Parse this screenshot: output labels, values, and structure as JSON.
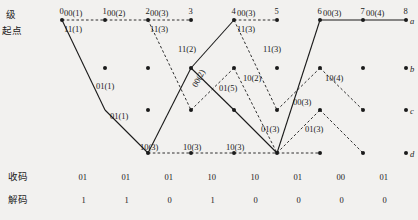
{
  "figure": {
    "type": "viterbi-trellis-diagram",
    "row_labels_left": [
      "级",
      "起点"
    ],
    "state_labels_right": [
      "a",
      "b",
      "c",
      "d"
    ],
    "stage_numbers": [
      "0",
      "1",
      "2",
      "3",
      "4",
      "5",
      "6",
      "7",
      "8"
    ],
    "bottom_rows": [
      {
        "name": "收码",
        "values": [
          "01",
          "01",
          "01",
          "10",
          "10",
          "01",
          "00",
          "01"
        ]
      },
      {
        "name": "解码",
        "values": [
          "1",
          "1",
          "0",
          "1",
          "0",
          "0",
          "0",
          "0"
        ]
      }
    ],
    "branch_labels": [
      {
        "text": "00(1)",
        "x": 64,
        "y": 9
      },
      {
        "text": "00(2)",
        "x": 107,
        "y": 9
      },
      {
        "text": "00(3)",
        "x": 150,
        "y": 9
      },
      {
        "text": "00(3)",
        "x": 237,
        "y": 9
      },
      {
        "text": "00(3)",
        "x": 323,
        "y": 9
      },
      {
        "text": "00(4)",
        "x": 366,
        "y": 9
      },
      {
        "text": "11(1)",
        "x": 64,
        "y": 25
      },
      {
        "text": "11(3)",
        "x": 150,
        "y": 25
      },
      {
        "text": "11(3)",
        "x": 237,
        "y": 25
      },
      {
        "text": "11(2)",
        "x": 178,
        "y": 45
      },
      {
        "text": "11(3)",
        "x": 263,
        "y": 45
      },
      {
        "text": "01(1)",
        "x": 96,
        "y": 82
      },
      {
        "text": "01(1)",
        "x": 110,
        "y": 112
      },
      {
        "text": "01(5)",
        "x": 219,
        "y": 84
      },
      {
        "text": "10(2)",
        "x": 243,
        "y": 74
      },
      {
        "text": "10(4)",
        "x": 325,
        "y": 74
      },
      {
        "text": "00(3)",
        "x": 293,
        "y": 98
      },
      {
        "text": "01(3)",
        "x": 261,
        "y": 125
      },
      {
        "text": "01(3)",
        "x": 305,
        "y": 125
      },
      {
        "text": "10(3)",
        "x": 140,
        "y": 143
      },
      {
        "text": "10(3)",
        "x": 183,
        "y": 143
      },
      {
        "text": "10(3)",
        "x": 226,
        "y": 143
      }
    ],
    "rotated_label": {
      "text": "00(2)",
      "x": 198,
      "y": 80
    },
    "colors": {
      "ink": "#1a1a1a",
      "paper": "#f2f1ef"
    }
  },
  "chart_data": {
    "type": "diagram",
    "columns_x": [
      62,
      105,
      148,
      191,
      234,
      277,
      320,
      363,
      406
    ],
    "rows_y": {
      "a": 20,
      "b": 68,
      "c": 110,
      "d": 153
    },
    "nodes": [
      {
        "stage": 0,
        "state": "a"
      },
      {
        "stage": 1,
        "state": "a"
      },
      {
        "stage": 1,
        "state": "b"
      },
      {
        "stage": 2,
        "state": "a"
      },
      {
        "stage": 2,
        "state": "b"
      },
      {
        "stage": 2,
        "state": "c"
      },
      {
        "stage": 2,
        "state": "d"
      },
      {
        "stage": 3,
        "state": "a"
      },
      {
        "stage": 3,
        "state": "b"
      },
      {
        "stage": 3,
        "state": "c"
      },
      {
        "stage": 3,
        "state": "d"
      },
      {
        "stage": 4,
        "state": "a"
      },
      {
        "stage": 4,
        "state": "b"
      },
      {
        "stage": 4,
        "state": "c"
      },
      {
        "stage": 4,
        "state": "d"
      },
      {
        "stage": 5,
        "state": "a"
      },
      {
        "stage": 5,
        "state": "b"
      },
      {
        "stage": 5,
        "state": "c"
      },
      {
        "stage": 5,
        "state": "d"
      },
      {
        "stage": 6,
        "state": "a"
      },
      {
        "stage": 6,
        "state": "b"
      },
      {
        "stage": 6,
        "state": "c"
      },
      {
        "stage": 6,
        "state": "d"
      },
      {
        "stage": 7,
        "state": "a"
      },
      {
        "stage": 7,
        "state": "b"
      },
      {
        "stage": 7,
        "state": "c"
      },
      {
        "stage": 7,
        "state": "d"
      },
      {
        "stage": 8,
        "state": "a"
      },
      {
        "stage": 8,
        "state": "b"
      },
      {
        "stage": 8,
        "state": "c"
      },
      {
        "stage": 8,
        "state": "d"
      }
    ],
    "edges_solid": [
      {
        "from": [
          0,
          "a"
        ],
        "to": [
          1,
          "c"
        ]
      },
      {
        "from": [
          1,
          "c"
        ],
        "to": [
          2,
          "d"
        ]
      },
      {
        "from": [
          2,
          "d"
        ],
        "to": [
          3,
          "b"
        ]
      },
      {
        "from": [
          3,
          "b"
        ],
        "to": [
          4,
          "a"
        ]
      },
      {
        "from": [
          3,
          "b"
        ],
        "to": [
          4,
          "c"
        ]
      },
      {
        "from": [
          4,
          "c"
        ],
        "to": [
          5,
          "d"
        ]
      },
      {
        "from": [
          5,
          "d"
        ],
        "to": [
          6,
          "a"
        ]
      },
      {
        "from": [
          6,
          "a"
        ],
        "to": [
          7,
          "a"
        ]
      },
      {
        "from": [
          7,
          "a"
        ],
        "to": [
          8,
          "a"
        ]
      }
    ],
    "edges_dashed": [
      {
        "from": [
          0,
          "a"
        ],
        "to": [
          1,
          "a"
        ]
      },
      {
        "from": [
          1,
          "a"
        ],
        "to": [
          2,
          "a"
        ]
      },
      {
        "from": [
          2,
          "a"
        ],
        "to": [
          3,
          "a"
        ]
      },
      {
        "from": [
          2,
          "a"
        ],
        "to": [
          3,
          "c"
        ]
      },
      {
        "from": [
          2,
          "d"
        ],
        "to": [
          3,
          "d"
        ]
      },
      {
        "from": [
          3,
          "d"
        ],
        "to": [
          4,
          "d"
        ]
      },
      {
        "from": [
          3,
          "c"
        ],
        "to": [
          4,
          "b"
        ]
      },
      {
        "from": [
          4,
          "a"
        ],
        "to": [
          5,
          "a"
        ]
      },
      {
        "from": [
          4,
          "a"
        ],
        "to": [
          5,
          "c"
        ]
      },
      {
        "from": [
          4,
          "d"
        ],
        "to": [
          5,
          "d"
        ]
      },
      {
        "from": [
          4,
          "b"
        ],
        "to": [
          5,
          "d"
        ]
      },
      {
        "from": [
          5,
          "d"
        ],
        "to": [
          6,
          "c"
        ]
      },
      {
        "from": [
          5,
          "c"
        ],
        "to": [
          6,
          "b"
        ]
      },
      {
        "from": [
          5,
          "d"
        ],
        "to": [
          6,
          "d"
        ]
      },
      {
        "from": [
          6,
          "b"
        ],
        "to": [
          7,
          "c"
        ]
      },
      {
        "from": [
          6,
          "c"
        ],
        "to": [
          7,
          "d"
        ]
      }
    ]
  }
}
